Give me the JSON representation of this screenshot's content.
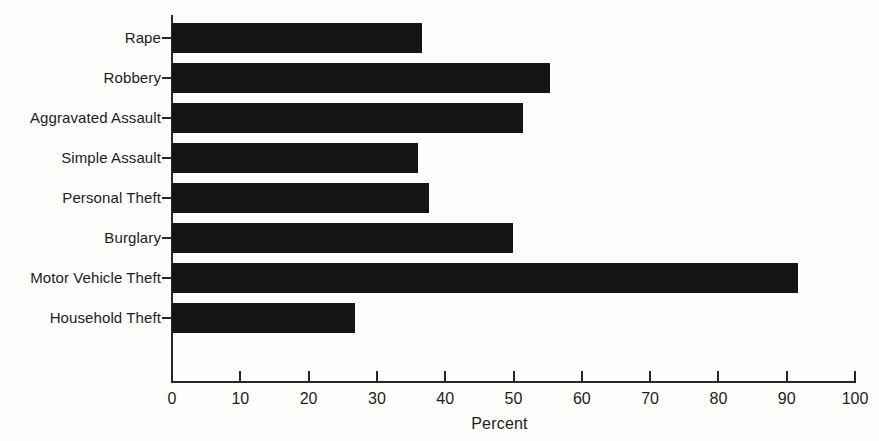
{
  "chart_data": {
    "type": "bar",
    "orientation": "horizontal",
    "title": "",
    "subtitle": "",
    "xlabel": "Percent",
    "ylabel": "",
    "categories": [
      "Rape",
      "Robbery",
      "Aggravated Assault",
      "Simple Assault",
      "Personal Theft",
      "Burglary",
      "Motor Vehicle Theft",
      "Household Theft"
    ],
    "values": [
      36.6,
      55.3,
      51.4,
      36.0,
      37.6,
      49.9,
      91.7,
      26.8
    ],
    "xlim": [
      0,
      100
    ],
    "xticks": [
      0,
      10,
      20,
      30,
      40,
      50,
      60,
      70,
      80,
      90,
      100
    ],
    "xtick_labels": [
      "0",
      "10",
      "20",
      "30",
      "40",
      "50",
      "60",
      "70",
      "80",
      "90",
      "100"
    ],
    "grid": false,
    "legend": false,
    "legend_position": "none",
    "bar_color": "#151515",
    "axis_color": "#272727",
    "background_color": "#fdfdfc",
    "annotations": []
  },
  "figure": {
    "axis_title_bottom": "Percent"
  }
}
